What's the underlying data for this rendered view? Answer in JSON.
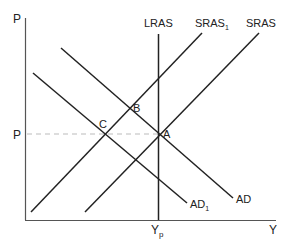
{
  "diagram": {
    "title": "",
    "axes": {
      "y_label": "P",
      "x_label": "Y",
      "price_tick_label": "P",
      "output_tick_label": "Y",
      "output_tick_sub": "p"
    },
    "curves": {
      "lras": {
        "label": "LRAS"
      },
      "sras1": {
        "label": "SRAS",
        "sub": "1"
      },
      "sras": {
        "label": "SRAS"
      },
      "ad": {
        "label": "AD"
      },
      "ad1": {
        "label": "AD",
        "sub": "1"
      }
    },
    "points": {
      "a": "A",
      "b": "B",
      "c": "C"
    },
    "colors": {
      "line": "#222222",
      "axis": "#444444",
      "dashed": "#bbbbbb"
    }
  }
}
